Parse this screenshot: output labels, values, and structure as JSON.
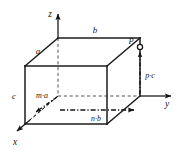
{
  "figure": {
    "background_color": "#ffffff",
    "line_color": "#1c1c1c",
    "hidden_line_color": "#555555",
    "axes": [
      {
        "name": "z-axis",
        "label": "z",
        "direction": "up"
      },
      {
        "name": "y-axis",
        "label": "y",
        "direction": "right"
      },
      {
        "name": "x-axis",
        "label": "x",
        "direction": "down-left"
      }
    ],
    "edge_labels": [
      {
        "name": "edge-a",
        "label": "a"
      },
      {
        "name": "edge-b",
        "label": "b"
      },
      {
        "name": "edge-c",
        "label": "c"
      }
    ],
    "vectors": [
      {
        "name": "vector-ma",
        "label": "m·a",
        "axis": "x"
      },
      {
        "name": "vector-nb",
        "label": "n·b",
        "axis": "y"
      },
      {
        "name": "vector-pc",
        "label": "p·c",
        "axis": "z"
      }
    ],
    "points": [
      {
        "name": "point-P",
        "label": "P"
      }
    ]
  }
}
